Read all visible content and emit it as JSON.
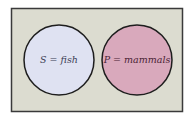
{
  "diagram": {
    "type": "venn",
    "background_color": "#dcdcd0",
    "border_color": "#3a3a3a",
    "sets": [
      {
        "id": "S",
        "label": "S = fish",
        "fill": "#dfe2f2",
        "cx": 59,
        "cy": 60,
        "r": 35
      },
      {
        "id": "P",
        "label": "P = mammals",
        "fill": "#d9a9bc",
        "cx": 137,
        "cy": 60,
        "r": 35
      }
    ],
    "overlap": false
  }
}
